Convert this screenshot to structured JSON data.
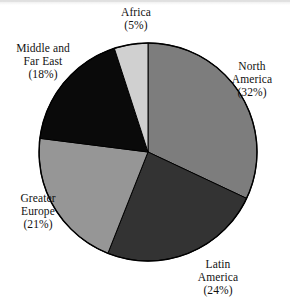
{
  "chart_data": {
    "type": "pie",
    "title": "",
    "subtitle": "",
    "xlabel": "",
    "ylabel": "",
    "legend_position": "none",
    "grid": false,
    "start_angle_deg": 0,
    "direction": "clockwise",
    "categories": [
      "North America",
      "Latin America",
      "Greater Europe",
      "Middle and Far East",
      "Africa"
    ],
    "values": [
      32,
      24,
      21,
      18,
      5
    ],
    "value_unit": "%",
    "total": 100,
    "slices": [
      {
        "name": "North America",
        "label_lines": [
          "North",
          "America",
          "(32%)"
        ],
        "value": 32,
        "percent_text": "(32%)",
        "color": "#7d7d7d",
        "start_deg": 0,
        "end_deg": 115.2,
        "label_position": "right"
      },
      {
        "name": "Latin America",
        "label_lines": [
          "Latin",
          "America",
          "(24%)"
        ],
        "value": 24,
        "percent_text": "(24%)",
        "color": "#333333",
        "start_deg": 115.2,
        "end_deg": 201.6,
        "label_position": "bottom-right"
      },
      {
        "name": "Greater Europe",
        "label_lines": [
          "Greater",
          "Europe",
          "(21%)"
        ],
        "value": 21,
        "percent_text": "(21%)",
        "color": "#969696",
        "start_deg": 201.6,
        "end_deg": 277.2,
        "label_position": "left-bottom"
      },
      {
        "name": "Middle and Far East",
        "label_lines": [
          "Middle and",
          "Far East",
          "(18%)"
        ],
        "value": 18,
        "percent_text": "(18%)",
        "color": "#0a0a0a",
        "start_deg": 277.2,
        "end_deg": 342.0,
        "label_position": "left-top"
      },
      {
        "name": "Africa",
        "label_lines": [
          "Africa",
          "(5%)"
        ],
        "value": 5,
        "percent_text": "(5%)",
        "color": "#d0d0d0",
        "start_deg": 342.0,
        "end_deg": 360.0,
        "label_position": "top"
      }
    ],
    "geometry": {
      "center_x": 148,
      "center_y": 152,
      "radius": 109,
      "outline_color": "#000000"
    },
    "background_color": "#ffffff"
  },
  "labels": {
    "africa": {
      "l1": "Africa",
      "l2": "(5%)"
    },
    "north_america": {
      "l1": "North",
      "l2": "America",
      "l3": "(32%)"
    },
    "latin_america": {
      "l1": "Latin",
      "l2": "America",
      "l3": "(24%)"
    },
    "greater_europe": {
      "l1": "Greater",
      "l2": "Europe",
      "l3": "(21%)"
    },
    "middle_far_east": {
      "l1": "Middle and",
      "l2": "Far East",
      "l3": "(18%)"
    }
  }
}
